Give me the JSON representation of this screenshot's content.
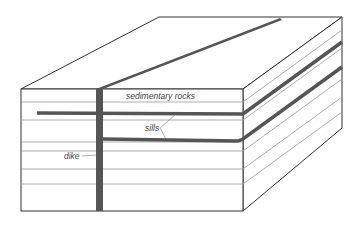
{
  "diagram": {
    "labels": {
      "sedimentary_rocks": "sedimentary rocks",
      "sills": "sills",
      "dike": "dike"
    },
    "colors": {
      "outline": "#333333",
      "layer_line": "#999999",
      "intrusion": "#555555",
      "label_text": "#444444"
    }
  }
}
